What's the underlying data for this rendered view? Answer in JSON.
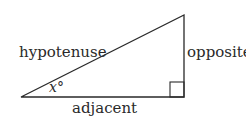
{
  "diagram": {
    "type": "right-triangle",
    "labels": {
      "hypotenuse": "hypotenuse",
      "opposite": "opposite",
      "adjacent": "adjacent",
      "angle": "x°"
    },
    "stroke_color": "#2a2a2a"
  }
}
